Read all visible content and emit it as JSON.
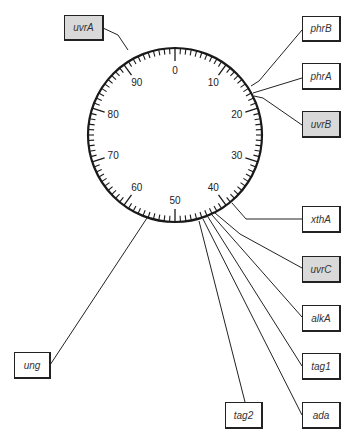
{
  "dial": {
    "center": [
      175,
      135
    ],
    "radius": 87,
    "total_units": 100,
    "major_every": 10,
    "labels": [
      "0",
      "10",
      "20",
      "30",
      "40",
      "50",
      "60",
      "70",
      "80",
      "90"
    ],
    "ring_color": "#1a1a1a"
  },
  "genes": [
    {
      "name": "uvrA",
      "position": 92,
      "shaded": true,
      "box": [
        64,
        15,
        40,
        26
      ],
      "path": [
        [
          103,
          28
        ],
        [
          118,
          35
        ],
        [
          128,
          50
        ]
      ]
    },
    {
      "name": "phrB",
      "position": 14.5,
      "shaded": false,
      "box": [
        302,
        16,
        39,
        26
      ],
      "path": [
        [
          302,
          30
        ],
        [
          259,
          81
        ],
        [
          251,
          86
        ]
      ]
    },
    {
      "name": "phrA",
      "position": 15.5,
      "shaded": false,
      "box": [
        302,
        63,
        39,
        27
      ],
      "path": [
        [
          302,
          78
        ],
        [
          253,
          93
        ]
      ]
    },
    {
      "name": "uvrB",
      "position": 16.5,
      "shaded": false,
      "box": [
        302,
        111,
        39,
        27
      ],
      "path": [
        [
          302,
          125
        ],
        [
          263,
          98
        ],
        [
          254,
          96
        ]
      ],
      "shaded_override": true
    },
    {
      "name": "xthA",
      "position": 38,
      "shaded": false,
      "box": [
        302,
        206,
        39,
        27
      ],
      "path": [
        [
          302,
          219
        ],
        [
          246,
          219
        ],
        [
          232,
          203
        ]
      ]
    },
    {
      "name": "uvrC",
      "position": 42,
      "shaded": true,
      "box": [
        302,
        256,
        39,
        27
      ],
      "path": [
        [
          302,
          268
        ],
        [
          240,
          234
        ],
        [
          215,
          213
        ]
      ]
    },
    {
      "name": "alkA",
      "position": 43,
      "shaded": false,
      "box": [
        302,
        305,
        39,
        27
      ],
      "path": [
        [
          302,
          317
        ],
        [
          212,
          215
        ]
      ]
    },
    {
      "name": "tag1",
      "position": 44,
      "shaded": false,
      "box": [
        302,
        353,
        39,
        27
      ],
      "path": [
        [
          302,
          366
        ],
        [
          208,
          217
        ]
      ]
    },
    {
      "name": "ada",
      "position": 45,
      "shaded": false,
      "box": [
        302,
        402,
        39,
        27
      ],
      "path": [
        [
          302,
          415
        ],
        [
          203,
          219
        ]
      ]
    },
    {
      "name": "tag2",
      "position": 46,
      "shaded": false,
      "box": [
        225,
        402,
        38,
        27
      ],
      "path": [
        [
          245,
          402
        ],
        [
          199,
          221
        ]
      ]
    },
    {
      "name": "ung",
      "position": 56,
      "shaded": false,
      "box": [
        14,
        352,
        37,
        27
      ],
      "path": [
        [
          50,
          365
        ],
        [
          147,
          218
        ]
      ]
    }
  ]
}
